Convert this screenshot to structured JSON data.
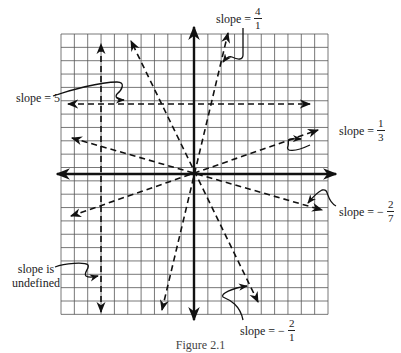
{
  "figure": {
    "caption": "Figure 2.1",
    "grid": {
      "left": 61,
      "top": 34,
      "cell": 13.35,
      "cols": 20,
      "rows": 21,
      "line_color": "#555555"
    },
    "axes": {
      "origin_px": [
        194,
        174
      ],
      "x_axis": {
        "from_px": 57,
        "to_px": 336
      },
      "y_axis": {
        "from_px": 27,
        "to_px": 320
      },
      "color": "#111111"
    },
    "lines": [
      {
        "name": "vertical-line",
        "slope": "undefined",
        "from": [
          101,
          312
        ],
        "to": [
          101,
          44
        ]
      },
      {
        "name": "horizontal-line",
        "slope": "0",
        "from": [
          68,
          104
        ],
        "to": [
          310,
          104
        ]
      },
      {
        "name": "line-slope-4",
        "slope": "4/1",
        "from": [
          162,
          310
        ],
        "to": [
          228,
          33
        ]
      },
      {
        "name": "line-slope-neg2",
        "slope": "-2/1",
        "from": [
          258,
          302
        ],
        "to": [
          131,
          41
        ]
      },
      {
        "name": "line-slope-1-3",
        "slope": "1/3",
        "from": [
          71,
          216
        ],
        "to": [
          318,
          130
        ]
      },
      {
        "name": "line-slope-neg2-7",
        "slope": "-2/7",
        "from": [
          72,
          138
        ],
        "to": [
          322,
          210
        ]
      }
    ],
    "labels": {
      "slope_5": {
        "text": "slope = 5"
      },
      "slope_4_1": {
        "prefix": "slope =",
        "num": "4",
        "den": "1"
      },
      "slope_1_3": {
        "prefix": "slope =",
        "num": "1",
        "den": "3"
      },
      "slope_neg2_7": {
        "prefix": "slope = −",
        "num": "2",
        "den": "7"
      },
      "slope_neg2_1": {
        "prefix": "slope = −",
        "num": "2",
        "den": "1"
      },
      "slope_undefined": {
        "line1": "slope is",
        "line2": "undefined"
      }
    }
  }
}
